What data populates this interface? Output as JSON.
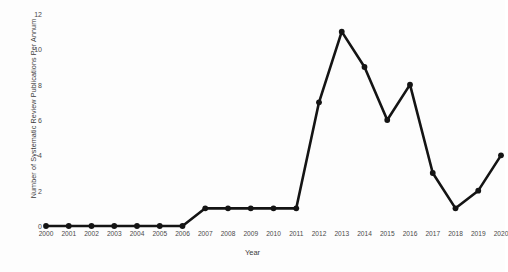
{
  "chart_data": {
    "type": "line",
    "title": "",
    "xlabel": "Year",
    "ylabel": "Number of Systematic Review Publications Per Annum",
    "x": [
      2000,
      2001,
      2002,
      2003,
      2004,
      2005,
      2006,
      2007,
      2008,
      2009,
      2010,
      2011,
      2012,
      2013,
      2014,
      2015,
      2016,
      2017,
      2018,
      2019,
      2020
    ],
    "categories": [
      "2000",
      "2001",
      "2002",
      "2003",
      "2004",
      "2005",
      "2006",
      "2007",
      "2008",
      "2009",
      "2010",
      "2011",
      "2012",
      "2013",
      "2014",
      "2015",
      "2016",
      "2017",
      "2018",
      "2019",
      "2020"
    ],
    "values": [
      0,
      0,
      0,
      0,
      0,
      0,
      0,
      1,
      1,
      1,
      1,
      1,
      7,
      11,
      9,
      6,
      8,
      3,
      1,
      2,
      4
    ],
    "series": [
      {
        "name": "Systematic Review Publications",
        "values": [
          0,
          0,
          0,
          0,
          0,
          0,
          0,
          1,
          1,
          1,
          1,
          1,
          7,
          11,
          9,
          6,
          8,
          3,
          1,
          2,
          4
        ]
      }
    ],
    "ylim": [
      0,
      12
    ],
    "xlim": [
      2000,
      2020
    ],
    "y_ticks": [
      0,
      2,
      4,
      6,
      8,
      10,
      12
    ],
    "y_tick_labels": [
      "0",
      "2",
      "4",
      "6",
      "8",
      "10",
      "12"
    ],
    "x_ticks": [
      2000,
      2001,
      2002,
      2003,
      2004,
      2005,
      2006,
      2007,
      2008,
      2009,
      2010,
      2011,
      2012,
      2013,
      2014,
      2015,
      2016,
      2017,
      2018,
      2019,
      2020
    ],
    "grid": false,
    "legend": false,
    "legend_position": "none",
    "line_color": "#141414",
    "marker": "circle",
    "background_color": "#fdfdfd"
  }
}
